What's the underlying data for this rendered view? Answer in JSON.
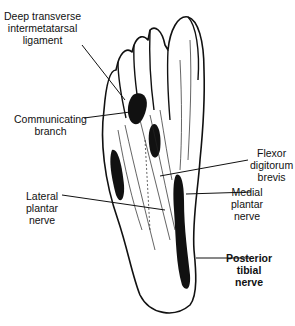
{
  "figure": {
    "labels": [
      {
        "id": "deep-transverse",
        "lines": [
          "Deep transverse",
          "intermetatarsal",
          "ligament"
        ]
      },
      {
        "id": "communicating-branch",
        "lines": [
          "Communicating",
          "branch"
        ]
      },
      {
        "id": "flexor-digitorum-brevis",
        "lines": [
          "Flexor",
          "digitorum",
          "brevis"
        ]
      },
      {
        "id": "lateral-plantar-nerve",
        "lines": [
          "Lateral",
          "plantar",
          "nerve"
        ]
      },
      {
        "id": "medial-plantar-nerve",
        "lines": [
          "Medial",
          "plantar",
          "nerve"
        ]
      },
      {
        "id": "posterior-tibial-nerve",
        "lines": [
          "Posterior",
          "tibial",
          "nerve"
        ]
      }
    ]
  }
}
